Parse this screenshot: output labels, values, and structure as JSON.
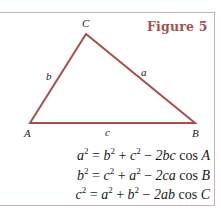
{
  "figure": {
    "title": "Figure 5",
    "accent_color": "#a2524e",
    "frame_color": "#c9b3b0"
  },
  "triangle": {
    "vertices": {
      "A": {
        "label": "A",
        "x": 30,
        "y": 123
      },
      "B": {
        "label": "B",
        "x": 195,
        "y": 123
      },
      "C": {
        "label": "C",
        "x": 86,
        "y": 34
      }
    },
    "sides": {
      "a": {
        "label": "a",
        "between": "B-C"
      },
      "b": {
        "label": "b",
        "between": "A-C"
      },
      "c": {
        "label": "c",
        "between": "A-B"
      }
    }
  },
  "equations": [
    {
      "lhs": "a",
      "t1": "b",
      "t2": "c",
      "coef": "2bc",
      "angle": "A"
    },
    {
      "lhs": "b",
      "t1": "c",
      "t2": "a",
      "coef": "2ca",
      "angle": "B"
    },
    {
      "lhs": "c",
      "t1": "a",
      "t2": "b",
      "coef": "2ab",
      "angle": "C"
    }
  ],
  "symbols": {
    "exp": "2",
    "eq": " = ",
    "plus": " + ",
    "minus": " − ",
    "cos": " cos "
  }
}
